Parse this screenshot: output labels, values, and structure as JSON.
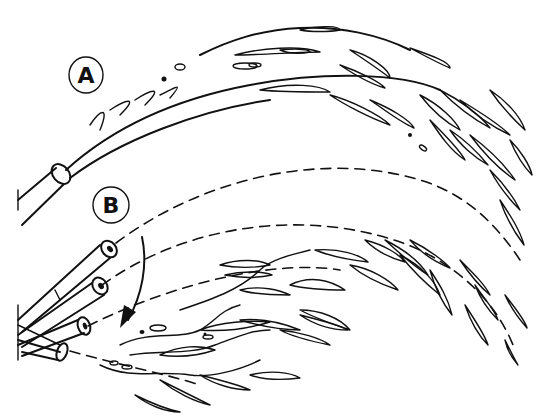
{
  "illustration": {
    "background": "#ffffff",
    "ink_color": "#111111",
    "labels": [
      {
        "id": "A",
        "text": "A",
        "cx": 86,
        "cy": 75
      },
      {
        "id": "B",
        "text": "B",
        "cx": 111,
        "cy": 205
      }
    ]
  }
}
